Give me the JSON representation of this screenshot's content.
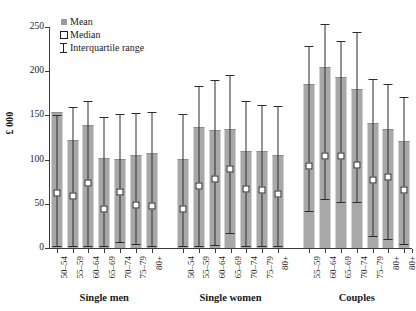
{
  "chart_data": {
    "type": "bar",
    "title": "",
    "xlabel": "",
    "ylabel": "£ 000",
    "ylim": [
      0,
      250
    ],
    "yticks": [
      0,
      50,
      100,
      150,
      200,
      250
    ],
    "grid": false,
    "legend_position": "top-left",
    "legend": [
      {
        "key": "mean",
        "label": "Mean"
      },
      {
        "key": "median",
        "label": "Median"
      },
      {
        "key": "iqr",
        "label": "Interquartile range"
      }
    ],
    "series_names": [
      "Mean",
      "Median",
      "Interquartile range"
    ],
    "groups": [
      {
        "name": "Single men",
        "categories": [
          "50–54",
          "55–59",
          "60–64",
          "65–69",
          "70–74",
          "75–79",
          "80+"
        ],
        "mean": [
          153,
          121,
          138,
          101,
          100,
          104,
          106
        ],
        "median": [
          66,
          62,
          77,
          47,
          67,
          52,
          51
        ],
        "iqr_low": [
          2,
          2,
          2,
          2,
          7,
          4,
          2
        ],
        "iqr_high": [
          151,
          160,
          166,
          148,
          152,
          153,
          154
        ]
      },
      {
        "name": "Single women",
        "categories": [
          "50–54",
          "55–59",
          "60–64",
          "65–69",
          "70–74",
          "75–79",
          "80+"
        ],
        "mean": [
          99,
          136,
          132,
          134,
          109,
          109,
          104
        ],
        "median": [
          48,
          74,
          82,
          93,
          70,
          69,
          64
        ],
        "iqr_low": [
          2,
          2,
          3,
          17,
          2,
          2,
          2
        ],
        "iqr_high": [
          152,
          183,
          190,
          196,
          166,
          162,
          161
        ]
      },
      {
        "name": "Couples",
        "categories": [
          "55–59",
          "60–64",
          "65–69",
          "70–74",
          "75–79",
          "80+"
        ],
        "mean": [
          184,
          204,
          192,
          179,
          140,
          134,
          120
        ],
        "median": [
          96,
          108,
          108,
          97,
          80,
          84,
          69
        ],
        "iqr_low": [
          42,
          55,
          52,
          52,
          14,
          10,
          5
        ],
        "iqr_high": [
          229,
          253,
          234,
          244,
          191,
          186,
          171
        ]
      }
    ],
    "extra_category": {
      "label": "80+",
      "belongs_to": "Couples"
    }
  }
}
